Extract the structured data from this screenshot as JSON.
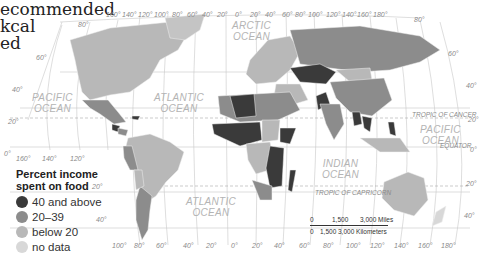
{
  "caption": {
    "lines": [
      "ecommended",
      "kcal",
      "ed"
    ]
  },
  "legend": {
    "title_line1": "Percent income",
    "title_line2": "spent on food",
    "items": [
      {
        "label": "40 and above",
        "color": "#3a3a3a"
      },
      {
        "label": "20–39",
        "color": "#8c8c8c"
      },
      {
        "label": "below 20",
        "color": "#b8b8b8"
      },
      {
        "label": "no data",
        "color": "#d8d8d8"
      }
    ]
  },
  "oceans": {
    "arctic": [
      "ARCTIC",
      "OCEAN"
    ],
    "pacific_west": [
      "PACIFIC",
      "OCEAN"
    ],
    "atlantic_north": [
      "ATLANTIC",
      "OCEAN"
    ],
    "atlantic_south": [
      "ATLANTIC",
      "OCEAN"
    ],
    "indian": [
      "INDIAN",
      "OCEAN"
    ],
    "pacific_east": [
      "PACIFIC",
      "OCEAN"
    ]
  },
  "lines": {
    "tropic_cancer": "TROPIC OF CANCER",
    "equator": "EQUATOR",
    "tropic_capricorn": "TROPIC OF CAPRICORN"
  },
  "graticule": {
    "top_longitudes": [
      "160°",
      "140°",
      "120°",
      "100°",
      "80°",
      "60°",
      "40°",
      "20°",
      "0°",
      "20°",
      "40°",
      "60°",
      "80°",
      "100°",
      "120°",
      "140°",
      "160°",
      "180°"
    ],
    "bottom_longitudes": [
      "100°",
      "80°",
      "60°",
      "40°",
      "20°",
      "0°",
      "20°",
      "40°",
      "60°",
      "80°",
      "100°",
      "120°",
      "140°",
      "160°",
      "180°"
    ],
    "left_pacific_longitudes": [
      "160°",
      "140°",
      "120°"
    ],
    "left_latitudes": [
      "80°",
      "60°",
      "40°",
      "20°",
      "0°",
      "20°",
      "40°"
    ],
    "right_latitudes": [
      "80°",
      "60°",
      "40°",
      "20°",
      "0°",
      "20°",
      "40°"
    ]
  },
  "scale_bar": {
    "miles": [
      "0",
      "1,500",
      "3,000 Miles"
    ],
    "km": [
      "0",
      "1,500",
      "3,000 Kilometers"
    ]
  }
}
